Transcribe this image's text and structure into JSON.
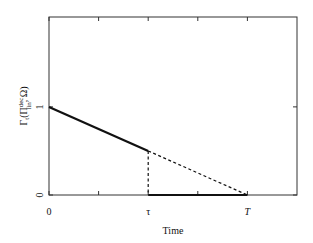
{
  "chart_data": {
    "type": "line",
    "title": "",
    "xlabel": "Time",
    "ylabel": "Γt(Π lin dec, Ω)",
    "ylabel_parts": {
      "main": "Γ",
      "sub_t": "t",
      "open": "(Π",
      "sup": "dec",
      "sub": "lin",
      "close": ", Ω)"
    },
    "xlim": [
      0,
      2.5
    ],
    "ylim": [
      0,
      2.02
    ],
    "x_ticks": [
      {
        "value": 0,
        "label": "0"
      },
      {
        "value": 1,
        "label": "τ"
      },
      {
        "value": 2,
        "label": "T"
      }
    ],
    "x_minor_ticks": [
      0.5,
      1.5
    ],
    "y_ticks": [
      {
        "value": 0,
        "label": "0"
      },
      {
        "value": 1,
        "label": "1"
      }
    ],
    "grid": false,
    "legend": null,
    "series": [
      {
        "name": "before-tau",
        "style": "solid-thick",
        "x": [
          0,
          1
        ],
        "y": [
          1,
          0.5
        ]
      },
      {
        "name": "extrapolated",
        "style": "dashed",
        "x": [
          1,
          2
        ],
        "y": [
          0.5,
          0
        ]
      },
      {
        "name": "drop-at-tau",
        "style": "dashed",
        "x": [
          1,
          1
        ],
        "y": [
          0.5,
          0
        ]
      },
      {
        "name": "after-tau",
        "style": "solid-thick",
        "x": [
          1,
          2
        ],
        "y": [
          0,
          0
        ]
      }
    ],
    "colors": {
      "line": "#111111",
      "axis": "#333333"
    }
  }
}
